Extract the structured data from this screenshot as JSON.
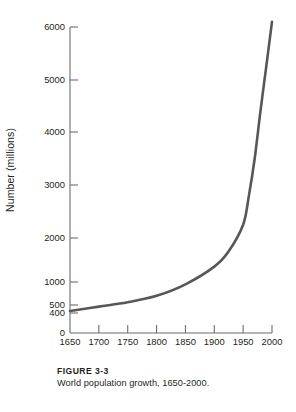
{
  "figure": {
    "label": "FIGURE 3-3",
    "caption": "World population growth, 1650-2000."
  },
  "chart_data": {
    "type": "line",
    "title": "",
    "subtitle": "",
    "xlabel": "",
    "ylabel": "Number (millions)",
    "xlim": [
      1650,
      2000
    ],
    "ylim": [
      0,
      6000
    ],
    "grid": false,
    "legend": null,
    "legend_position": "none",
    "axis_scale_note": "Y axis is non-linear below 1000: ticks at 0, 400, 500 are compressed near the baseline.",
    "xticks": [
      1650,
      1700,
      1750,
      1800,
      1850,
      1900,
      1950,
      2000
    ],
    "xtick_labels": [
      "1650",
      "1700",
      "1750",
      "1800",
      "1850",
      "1900",
      "1950",
      "2000"
    ],
    "yticks": [
      0,
      400,
      500,
      1000,
      2000,
      3000,
      4000,
      5000,
      6000
    ],
    "ytick_labels": [
      "0",
      "400",
      "500",
      "1000",
      "2000",
      "3000",
      "4000",
      "5000",
      "6000"
    ],
    "series": [
      {
        "name": "World population",
        "color": "#575757",
        "line_width": 2.6,
        "x": [
          1650,
          1700,
          1750,
          1800,
          1850,
          1900,
          1925,
          1950,
          1960,
          1970,
          1980,
          1990,
          2000
        ],
        "values": [
          425,
          480,
          560,
          700,
          950,
          1350,
          1700,
          2250,
          2800,
          3500,
          4400,
          5250,
          6100
        ]
      }
    ],
    "annotations": []
  }
}
